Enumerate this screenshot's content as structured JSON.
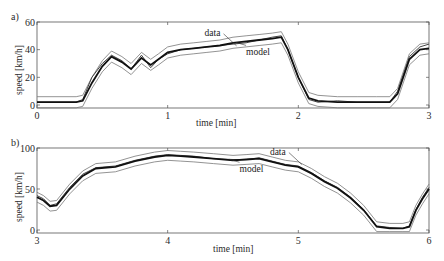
{
  "chart_data": [
    {
      "panel_label": "a)",
      "type": "line",
      "title": "",
      "xlabel": "time  [min]",
      "ylabel": "speed  [km/h]",
      "xlim": [
        0,
        3
      ],
      "ylim": [
        0,
        60
      ],
      "xticks": [
        0,
        1,
        2,
        3
      ],
      "xtick_labels": [
        "0",
        "1",
        "2",
        "3"
      ],
      "yticks": [
        0,
        20,
        40,
        60
      ],
      "ytick_labels": [
        "0",
        "20",
        "40",
        "60"
      ],
      "grid": false,
      "legend": null,
      "annotations": [
        {
          "text": "data",
          "x": 1.42,
          "y": 50
        },
        {
          "text": "model",
          "x": 1.6,
          "y": 38
        }
      ],
      "band_halfwidth": 4,
      "x": [
        0,
        0.3,
        0.35,
        0.42,
        0.5,
        0.57,
        0.65,
        0.72,
        0.8,
        0.87,
        0.93,
        1.0,
        1.1,
        1.2,
        1.3,
        1.4,
        1.5,
        1.6,
        1.7,
        1.8,
        1.87,
        1.92,
        2.0,
        2.08,
        2.15,
        2.3,
        2.45,
        2.6,
        2.7,
        2.76,
        2.85,
        2.93,
        3.0
      ],
      "series": [
        {
          "name": "data",
          "values": [
            2,
            2,
            4,
            20,
            30,
            36,
            32,
            26,
            36,
            27,
            33,
            37,
            40,
            41,
            42,
            43,
            44,
            45,
            47,
            49,
            50,
            40,
            20,
            4,
            2,
            3,
            2,
            2,
            2,
            10,
            35,
            42,
            44
          ]
        },
        {
          "name": "model",
          "values": [
            2,
            2,
            3,
            16,
            28,
            35,
            31,
            26,
            34,
            29,
            33,
            38,
            40,
            41,
            42,
            43,
            45,
            46,
            47,
            48,
            49,
            40,
            20,
            5,
            3,
            2,
            2,
            2,
            2,
            8,
            33,
            40,
            41
          ]
        }
      ]
    },
    {
      "panel_label": "b)",
      "type": "line",
      "title": "",
      "xlabel": "time  [min]",
      "ylabel": "speed  [km/h]",
      "xlim": [
        3,
        6
      ],
      "ylim": [
        0,
        100
      ],
      "xticks": [
        3,
        4,
        5,
        6
      ],
      "xtick_labels": [
        "3",
        "4",
        "5",
        "6"
      ],
      "yticks": [
        0,
        50,
        100
      ],
      "ytick_labels": [
        "0",
        "50",
        "100"
      ],
      "grid": false,
      "legend": null,
      "annotations": [
        {
          "text": "data",
          "x": 4.92,
          "y": 92
        },
        {
          "text": "model",
          "x": 4.55,
          "y": 74
        }
      ],
      "band_halfwidth": 6,
      "x": [
        3,
        3.05,
        3.1,
        3.15,
        3.25,
        3.35,
        3.45,
        3.6,
        3.75,
        3.9,
        4.0,
        4.1,
        4.2,
        4.35,
        4.5,
        4.6,
        4.7,
        4.8,
        4.9,
        5.0,
        5.1,
        5.2,
        5.3,
        5.4,
        5.5,
        5.6,
        5.7,
        5.8,
        5.85,
        5.9,
        5.95,
        6.0
      ],
      "series": [
        {
          "name": "data",
          "values": [
            42,
            38,
            30,
            32,
            52,
            68,
            76,
            78,
            85,
            90,
            92,
            91,
            90,
            87,
            86,
            86,
            88,
            84,
            80,
            78,
            70,
            60,
            52,
            40,
            25,
            5,
            3,
            2,
            5,
            25,
            40,
            52
          ]
        },
        {
          "name": "model",
          "values": [
            40,
            36,
            29,
            30,
            50,
            66,
            75,
            77,
            84,
            89,
            91,
            90,
            89,
            87,
            85,
            86,
            87,
            83,
            79,
            77,
            69,
            59,
            51,
            39,
            24,
            4,
            2,
            2,
            4,
            24,
            38,
            50
          ]
        }
      ]
    }
  ]
}
